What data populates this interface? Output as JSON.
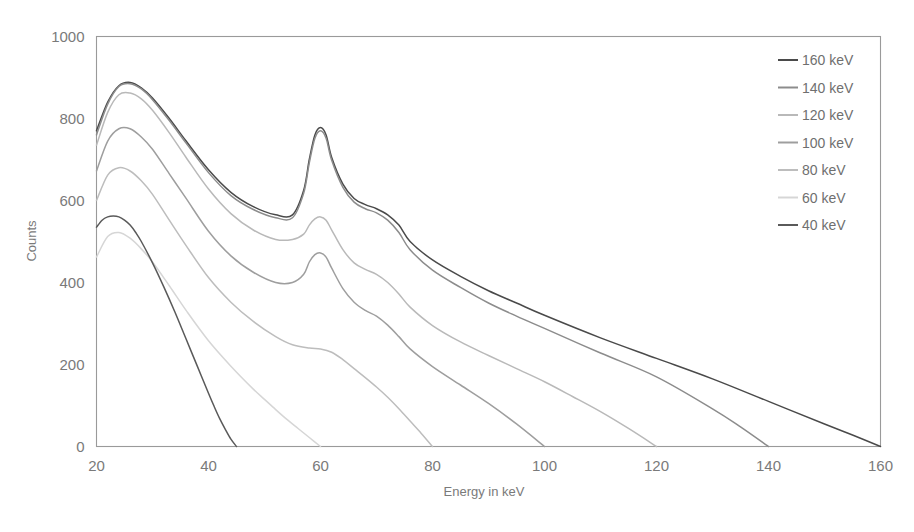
{
  "chart_data": {
    "type": "line",
    "title": "",
    "xlabel": "Energy in keV",
    "ylabel": "Counts",
    "xlim": [
      20,
      160
    ],
    "ylim": [
      0,
      1000
    ],
    "xticks": [
      20,
      40,
      60,
      80,
      100,
      120,
      140,
      160
    ],
    "yticks": [
      0,
      200,
      400,
      600,
      800,
      1000
    ],
    "grid": false,
    "legend_position": "top-right",
    "legend_entries": [
      "160 keV",
      "140 keV",
      "120 keV",
      "100 keV",
      "80 keV",
      "60 keV",
      "40 keV"
    ],
    "series": [
      {
        "name": "160 keV",
        "color": "#4a4a4a",
        "x": [
          20,
          22,
          24,
          26,
          28,
          30,
          33,
          36,
          40,
          44,
          48,
          52,
          55,
          57,
          58,
          59,
          60,
          61,
          62,
          64,
          66,
          68,
          70,
          72,
          74,
          76,
          80,
          85,
          90,
          95,
          100,
          110,
          120,
          130,
          140,
          150,
          155,
          160
        ],
        "y": [
          770,
          840,
          880,
          888,
          875,
          850,
          800,
          745,
          675,
          620,
          585,
          565,
          565,
          625,
          700,
          760,
          778,
          760,
          705,
          640,
          605,
          590,
          580,
          565,
          540,
          500,
          455,
          415,
          380,
          350,
          320,
          265,
          215,
          165,
          110,
          55,
          28,
          0
        ]
      },
      {
        "name": "140 keV",
        "color": "#8c8c8c",
        "x": [
          20,
          22,
          24,
          26,
          28,
          30,
          33,
          36,
          40,
          44,
          48,
          52,
          55,
          57,
          58,
          59,
          60,
          61,
          62,
          64,
          66,
          68,
          70,
          72,
          74,
          76,
          80,
          85,
          90,
          95,
          100,
          110,
          120,
          130,
          135,
          140
        ],
        "y": [
          760,
          835,
          878,
          885,
          872,
          846,
          795,
          740,
          668,
          612,
          578,
          558,
          558,
          618,
          692,
          752,
          770,
          752,
          698,
          632,
          596,
          580,
          570,
          552,
          522,
          480,
          430,
          388,
          350,
          318,
          288,
          228,
          170,
          92,
          48,
          0
        ]
      },
      {
        "name": "120 keV",
        "color": "#b9b9b9",
        "x": [
          20,
          22,
          24,
          26,
          28,
          30,
          33,
          36,
          40,
          44,
          48,
          52,
          55,
          57,
          58,
          59,
          60,
          61,
          62,
          64,
          66,
          68,
          70,
          72,
          74,
          76,
          80,
          85,
          90,
          95,
          100,
          105,
          110,
          115,
          120
        ],
        "y": [
          735,
          815,
          858,
          862,
          848,
          820,
          765,
          705,
          628,
          568,
          528,
          505,
          505,
          518,
          540,
          555,
          560,
          552,
          528,
          480,
          448,
          432,
          420,
          400,
          372,
          340,
          295,
          255,
          222,
          190,
          158,
          122,
          85,
          44,
          0
        ]
      },
      {
        "name": "100 keV",
        "color": "#9e9e9e",
        "x": [
          20,
          22,
          24,
          26,
          28,
          30,
          33,
          36,
          40,
          44,
          48,
          52,
          55,
          57,
          58,
          59,
          60,
          61,
          62,
          64,
          66,
          68,
          70,
          72,
          74,
          76,
          80,
          85,
          90,
          95,
          100
        ],
        "y": [
          672,
          745,
          775,
          775,
          755,
          725,
          665,
          605,
          525,
          465,
          425,
          400,
          400,
          420,
          450,
          468,
          472,
          462,
          435,
          385,
          352,
          332,
          318,
          296,
          268,
          238,
          195,
          150,
          105,
          55,
          0
        ]
      },
      {
        "name": "80 keV",
        "color": "#bdbdbd",
        "x": [
          20,
          22,
          24,
          26,
          28,
          30,
          33,
          36,
          40,
          44,
          48,
          52,
          55,
          58,
          60,
          62,
          64,
          66,
          68,
          70,
          72,
          74,
          76,
          78,
          80
        ],
        "y": [
          600,
          662,
          680,
          672,
          648,
          615,
          552,
          490,
          412,
          352,
          305,
          268,
          248,
          240,
          238,
          230,
          212,
          190,
          168,
          145,
          120,
          92,
          62,
          32,
          0
        ]
      },
      {
        "name": "60 keV",
        "color": "#d6d6d6",
        "x": [
          20,
          22,
          24,
          26,
          28,
          30,
          33,
          36,
          40,
          44,
          48,
          50,
          52,
          54,
          56,
          58,
          60
        ],
        "y": [
          462,
          512,
          522,
          508,
          482,
          450,
          392,
          332,
          258,
          196,
          140,
          115,
          90,
          66,
          44,
          22,
          0
        ]
      },
      {
        "name": "40 keV",
        "color": "#5a5a5a",
        "x": [
          20,
          21,
          22,
          23,
          24,
          25,
          26,
          27,
          28,
          30,
          32,
          34,
          36,
          38,
          40,
          41,
          42,
          43,
          44,
          45
        ],
        "y": [
          535,
          552,
          560,
          562,
          560,
          552,
          540,
          522,
          500,
          448,
          390,
          328,
          262,
          196,
          130,
          98,
          68,
          42,
          18,
          0
        ]
      }
    ]
  },
  "axes": {
    "y_tick_labels": [
      "1000",
      "800",
      "600",
      "400",
      "200",
      "0"
    ],
    "x_tick_labels": [
      "20",
      "40",
      "60",
      "80",
      "100",
      "120",
      "140",
      "160"
    ],
    "y_axis_title": "Counts",
    "x_axis_title": "Energy in keV"
  },
  "legend": {
    "items": [
      {
        "label": "160 keV",
        "color": "#4a4a4a"
      },
      {
        "label": "140 keV",
        "color": "#8c8c8c"
      },
      {
        "label": "120 keV",
        "color": "#b9b9b9"
      },
      {
        "label": "100 keV",
        "color": "#9e9e9e"
      },
      {
        "label": "80 keV",
        "color": "#bdbdbd"
      },
      {
        "label": "60 keV",
        "color": "#d6d6d6"
      },
      {
        "label": "40 keV",
        "color": "#5a5a5a"
      }
    ]
  },
  "colors": {
    "background": "#ffffff",
    "frame": "#9a9a9a",
    "text": "#7a7a7a"
  }
}
